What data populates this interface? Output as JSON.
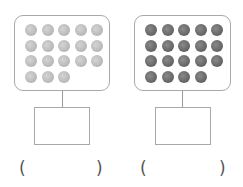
{
  "groups": [
    {
      "id": "left",
      "ball_count": 18,
      "ball_style": "light",
      "rows": [
        5,
        5,
        5,
        3
      ],
      "answer_box_value": "",
      "paren_open": "(",
      "paren_close": ")",
      "paren_value": ""
    },
    {
      "id": "right",
      "ball_count": 19,
      "ball_style": "dark",
      "rows": [
        5,
        5,
        5,
        4
      ],
      "answer_box_value": "",
      "paren_open": "(",
      "paren_close": ")",
      "paren_value": ""
    }
  ],
  "colors": {
    "frame_border": "#a9a9a9",
    "light_ball": "#bdbdbd",
    "dark_ball": "#6a6a6a"
  }
}
